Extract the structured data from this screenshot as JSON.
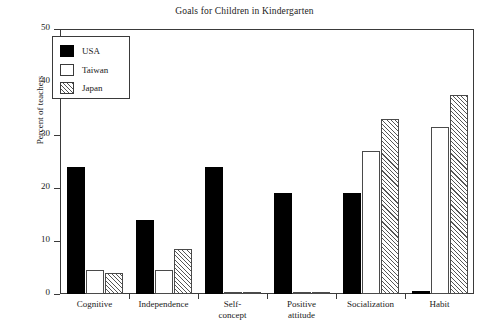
{
  "chart_data": {
    "type": "bar",
    "title": "Goals for Children in Kindergarten",
    "xlabel": "",
    "ylabel": "Percent of teachers",
    "ylim": [
      0,
      50
    ],
    "yticks": [
      0,
      10,
      20,
      30,
      40,
      50
    ],
    "grid": false,
    "legend_position": "top-left",
    "categories": [
      "Cognitive",
      "Independence",
      "Self-concept",
      "Positive attitude",
      "Socialization",
      "Habit"
    ],
    "category_lines": [
      [
        "Cognitive"
      ],
      [
        "Independence"
      ],
      [
        "Self-",
        "concept"
      ],
      [
        "Positive",
        "attitude"
      ],
      [
        "Socialization"
      ],
      [
        "Habit"
      ]
    ],
    "series": [
      {
        "name": "USA",
        "style": "solid-black",
        "color": "#000000",
        "values": [
          24,
          14,
          24,
          19,
          19,
          0.5
        ]
      },
      {
        "name": "Taiwan",
        "style": "open-white",
        "color": "#ffffff",
        "values": [
          4.5,
          4.5,
          0.4,
          0.4,
          27,
          31.5
        ]
      },
      {
        "name": "Japan",
        "style": "diagonal-hatch",
        "color": "#ffffff",
        "values": [
          4,
          8.5,
          0.3,
          0.3,
          33,
          37.5
        ]
      }
    ]
  },
  "axes": {
    "y_tick_labels": [
      "0",
      "10",
      "20",
      "30",
      "40",
      "50"
    ],
    "y_axis_title": "Percent of teachers"
  },
  "legend": {
    "entries": [
      {
        "label": "USA"
      },
      {
        "label": "Taiwan"
      },
      {
        "label": "Japan"
      }
    ]
  },
  "colors": {
    "axis": "#3a3a3a",
    "usa_fill": "#000000",
    "taiwan_fill": "#ffffff",
    "japan_hatch": "#555555",
    "text": "#222222",
    "background": "#ffffff"
  }
}
